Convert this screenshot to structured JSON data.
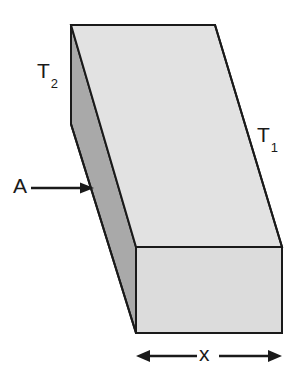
{
  "figure": {
    "name": "rectangular-slab-heat-conduction",
    "background_color": "#ffffff",
    "labels": {
      "t2_symbol": "T",
      "t2_subscript": "2",
      "t1_symbol": "T",
      "t1_subscript": "1",
      "area_symbol": "A",
      "length_symbol": "x"
    },
    "colors": {
      "top_face": "#e2e2e2",
      "front_face": "#dcdcdc",
      "side_face": "#a9a9a9",
      "outline": "#1a1a1a",
      "text": "#1a1a1a",
      "arrow": "#1a1a1a"
    },
    "geometry": {
      "top_back_left": "71,25",
      "top_back_right": "215,25",
      "top_front_right": "282,247",
      "top_front_left": "136,247",
      "bottom_front_left": "136,333",
      "bottom_front_right": "282,333",
      "side_mid_left": "91,190"
    },
    "annotations": {
      "area_arrow": "single-headed arrow pointing right at the shaded left end face",
      "length_arrow": "double-headed horizontal arrow spanning the front face width"
    }
  }
}
